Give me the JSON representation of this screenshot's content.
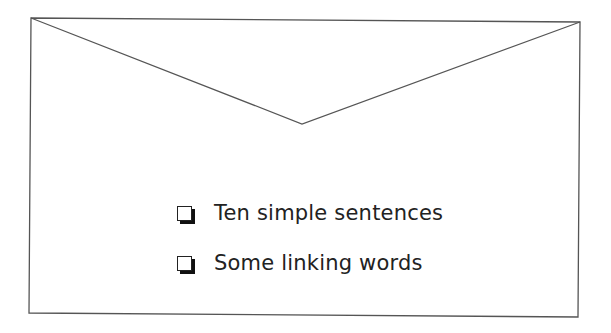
{
  "envelope": {
    "stroke_color": "#555555",
    "corners": {
      "top_left": [
        31,
        18
      ],
      "top_right": [
        580,
        22
      ],
      "bottom_right": [
        578,
        317
      ],
      "bottom_left": [
        29,
        313
      ]
    },
    "flap_point": [
      302,
      124
    ]
  },
  "checklist": {
    "items": [
      {
        "label": "Ten simple sentences",
        "checked": false
      },
      {
        "label": "Some linking words",
        "checked": false
      }
    ]
  }
}
